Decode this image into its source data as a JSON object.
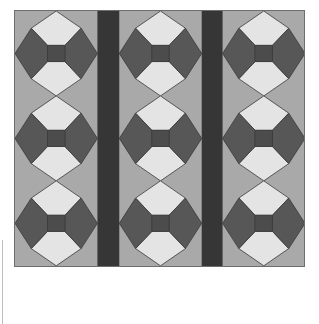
{
  "image": {
    "description": "Quilt pattern: 3 columns by 3 rows of diamond-on-point bowtie blocks separated by two dark vertical sashing strips",
    "columns": 3,
    "rows": 3
  },
  "colors": {
    "background": "#ffffff",
    "corner_fill": "#a9a9a9",
    "light_patch": "#e4e4e4",
    "dark_patch": "#575757",
    "center_square": "#4c4c4c",
    "sashing": "#363636",
    "outline": "#3a3a3a"
  },
  "layout": {
    "quilt_x": 14,
    "quilt_y": 10,
    "quilt_w": 291,
    "quilt_h": 257,
    "block_columns_x": [
      0,
      105,
      209
    ],
    "block_w": 83,
    "block_h": 85.6,
    "sashing": [
      {
        "x": 83,
        "w": 22
      },
      {
        "x": 188,
        "w": 21
      }
    ]
  }
}
